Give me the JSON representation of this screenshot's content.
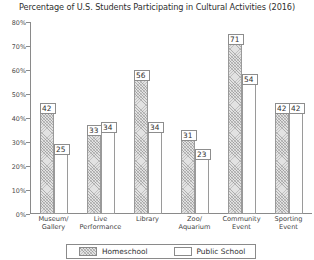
{
  "chart_data": {
    "type": "bar",
    "title": "Percentage of U.S. Students Participating in Cultural Activities (2016)",
    "xlabel": "",
    "ylabel": "",
    "ylim": [
      0,
      80
    ],
    "grid": false,
    "legend_position": "bottom",
    "ytick_labels": [
      "0%",
      "10%",
      "20%",
      "30%",
      "40%",
      "50%",
      "60%",
      "70%",
      "80%"
    ],
    "ytick_values": [
      0,
      10,
      20,
      30,
      40,
      50,
      60,
      70,
      80
    ],
    "categories": [
      "Museum/\nGallery",
      "Live\nPerformance",
      "Library",
      "Zoo/\nAquarium",
      "Community\nEvent",
      "Sporting\nEvent"
    ],
    "series": [
      {
        "name": "Homeschool",
        "values": [
          42,
          33,
          56,
          31,
          71,
          42
        ]
      },
      {
        "name": "Public School",
        "values": [
          25,
          34,
          34,
          23,
          54,
          42
        ]
      }
    ],
    "value_labels": [
      [
        "42",
        "25"
      ],
      [
        "33",
        "34"
      ],
      [
        "56",
        "34"
      ],
      [
        "31",
        "23"
      ],
      [
        "71",
        "54"
      ],
      [
        "42",
        "42"
      ]
    ],
    "colors": {
      "homeschool_fill": "#e2e2e2",
      "homeschool_hatch": "#828282",
      "public_fill": "#ffffff",
      "bar_border": "#9a9a9a",
      "axis": "#8a8a8a",
      "text": "#2f2f2f"
    }
  },
  "legend": {
    "items": [
      {
        "label": "Homeschool"
      },
      {
        "label": "Public School"
      }
    ]
  }
}
